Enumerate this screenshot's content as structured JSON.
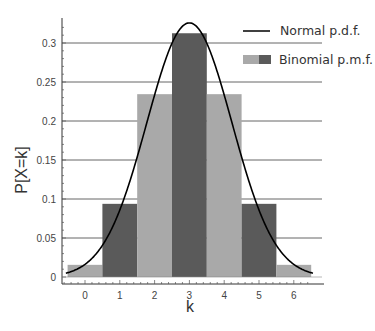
{
  "chart_data": {
    "type": "bar",
    "title": "",
    "xlabel": "k",
    "ylabel": "P[X=k]",
    "categories": [
      "0",
      "1",
      "2",
      "3",
      "4",
      "5",
      "6"
    ],
    "x": [
      0,
      1,
      2,
      3,
      4,
      5,
      6
    ],
    "xlim": [
      -0.65,
      6.65
    ],
    "ylim": [
      0,
      0.33
    ],
    "yticks": [
      0,
      0.05,
      0.1,
      0.15,
      0.2,
      0.25,
      0.3
    ],
    "ytick_labels": [
      "0",
      "0.05",
      "0.1",
      "0.15",
      "0.2",
      "0.25",
      "0.3"
    ],
    "grid": "horizontal lines at y ticks",
    "legend_position": "upper right",
    "series": [
      {
        "name": "Binomial p.m.f.",
        "kind": "bar",
        "values": [
          0.0156,
          0.0938,
          0.2344,
          0.3125,
          0.2344,
          0.0938,
          0.0156
        ],
        "colors": [
          "#a9a9a9",
          "#5a5a5a",
          "#a9a9a9",
          "#5a5a5a",
          "#a9a9a9",
          "#5a5a5a",
          "#a9a9a9"
        ]
      },
      {
        "name": "Normal p.d.f.",
        "kind": "line",
        "mean": 3,
        "sd": 1.2247,
        "color": "#000000"
      }
    ]
  },
  "legend": {
    "normal_label": "Normal p.d.f.",
    "binomial_label": "Binomial p.m.f."
  },
  "axes": {
    "xlabel": "k",
    "ylabel": "P[X=k]"
  },
  "colors": {
    "light_bar": "#a9a9a9",
    "dark_bar": "#5a5a5a",
    "grid": "#666666",
    "curve": "#000000"
  }
}
